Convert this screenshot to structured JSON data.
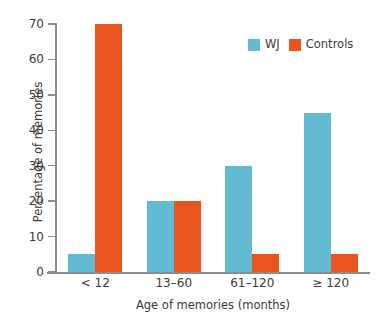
{
  "chart_data": {
    "type": "bar",
    "title": "",
    "subtitle": "",
    "xlabel": "Age of memories (months)",
    "ylabel": "Percentage of memories",
    "categories": [
      "< 12",
      "13–60",
      "61–120",
      "≥ 120"
    ],
    "series": [
      {
        "name": "WJ",
        "color": "#62BAD3",
        "values": [
          5,
          20,
          30,
          45
        ]
      },
      {
        "name": "Controls",
        "color": "#E8551F",
        "values": [
          70,
          20,
          5,
          5
        ]
      }
    ],
    "ylim": [
      0,
      70
    ],
    "ytick_values": [
      0,
      10,
      20,
      30,
      40,
      50,
      60,
      70
    ],
    "ytick_labels": [
      "0",
      "10",
      "20",
      "30",
      "40",
      "50",
      "60",
      "70"
    ],
    "grid": false,
    "legend_position": "top-right",
    "axis_color": "#8d8d8d",
    "text_color": "#3a3a3a",
    "background": "#ffffff",
    "units": "percent"
  },
  "legend": {
    "entries": [
      {
        "label": "WJ",
        "color": "#62BAD3"
      },
      {
        "label": "Controls",
        "color": "#E8551F"
      }
    ]
  }
}
